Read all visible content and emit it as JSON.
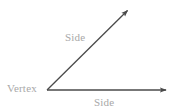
{
  "figure": {
    "type": "angle-diagram",
    "background_color": "#ffffff",
    "width": 173,
    "height": 112,
    "stroke_color": "#4a4a4a",
    "label_color": "#a8a8a8"
  },
  "labels": {
    "vertex": "Vertex",
    "side_upper": "Side",
    "side_lower": "Side"
  },
  "geometry": {
    "vertex_point": {
      "x": 47,
      "y": 90
    },
    "rays": [
      {
        "name": "horizontal-ray",
        "from": {
          "x": 47,
          "y": 90
        },
        "to": {
          "x": 170,
          "y": 90
        },
        "arrowhead": "end"
      },
      {
        "name": "diagonal-ray",
        "from": {
          "x": 47,
          "y": 90
        },
        "to": {
          "x": 131,
          "y": 7
        },
        "arrowhead": "end"
      }
    ]
  }
}
